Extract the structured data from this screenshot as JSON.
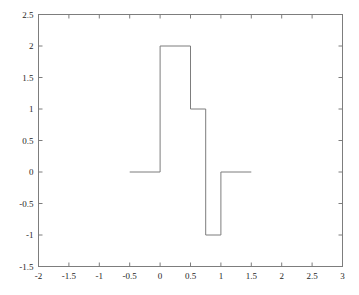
{
  "chart_data": {
    "type": "line",
    "subtype": "step",
    "title": "",
    "xlabel": "",
    "ylabel": "",
    "xlim": [
      -2,
      3
    ],
    "ylim": [
      -1.5,
      2.5
    ],
    "grid": false,
    "legend": null,
    "xticks": [
      -2,
      -1.5,
      -1,
      -0.5,
      0,
      0.5,
      1,
      1.5,
      2,
      2.5,
      3
    ],
    "xtick_labels": [
      "-2",
      "-1.5",
      "-1",
      "-0.5",
      "0",
      "0.5",
      "1",
      "1.5",
      "2",
      "2.5",
      "3"
    ],
    "yticks": [
      -1.5,
      -1,
      -0.5,
      0,
      0.5,
      1,
      1.5,
      2,
      2.5
    ],
    "ytick_labels": [
      "-1.5",
      "-1",
      "-0.5",
      "0",
      "0.5",
      "1",
      "1.5",
      "2",
      "2.5"
    ],
    "series": [
      {
        "name": "step-signal",
        "color": "#7d7d7d",
        "line_width": 1,
        "steps": [
          {
            "x_start": -0.5,
            "x_end": 0,
            "y": 0
          },
          {
            "x_start": 0,
            "x_end": 0.5,
            "y": 2
          },
          {
            "x_start": 0.5,
            "x_end": 0.75,
            "y": 1
          },
          {
            "x_start": 0.75,
            "x_end": 1,
            "y": -1
          },
          {
            "x_start": 1,
            "x_end": 1.5,
            "y": 0
          }
        ],
        "points": [
          [
            -0.5,
            0
          ],
          [
            0,
            0
          ],
          [
            0,
            2
          ],
          [
            0.5,
            2
          ],
          [
            0.5,
            1
          ],
          [
            0.75,
            1
          ],
          [
            0.75,
            -1
          ],
          [
            1,
            -1
          ],
          [
            1,
            0
          ],
          [
            1.5,
            0
          ]
        ]
      }
    ]
  },
  "figure": {
    "background_color": "#ffffff",
    "axes_color": "#7d7d7d",
    "tick_color": "#7d7d7d",
    "text_color": "#262626"
  }
}
